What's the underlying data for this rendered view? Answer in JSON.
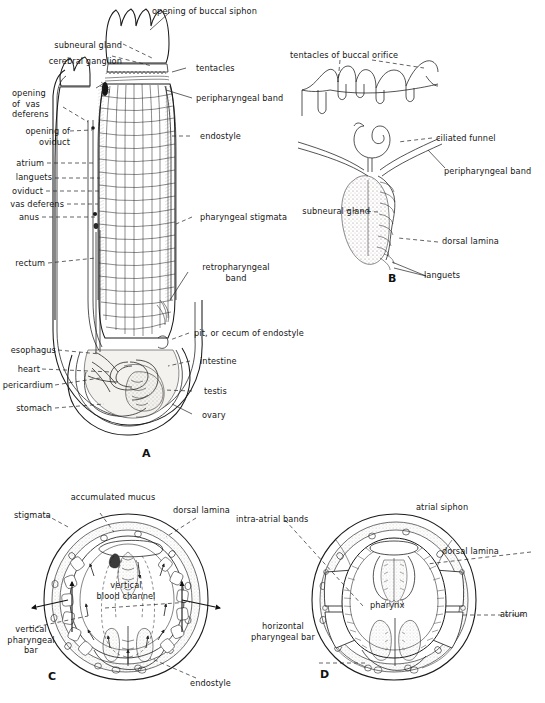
{
  "figure": {
    "panels": [
      {
        "id": "A",
        "letter": "A",
        "description": "Whole animal, left side view with body wall removed showing pharynx and viscera"
      },
      {
        "id": "B",
        "letter": "B",
        "description": "Detail of dorsal region: tentacles, ciliated funnel, subneural gland and dorsal lamina"
      },
      {
        "id": "C",
        "letter": "C",
        "description": "Transverse section of pharynx showing mucus and ciliary currents"
      },
      {
        "id": "D",
        "letter": "D",
        "description": "Transverse section showing pharynx, atrium and atrial siphon"
      }
    ],
    "caption_fragment": ""
  },
  "panelA": {
    "letter": "A",
    "labels": {
      "opening_of_buccal_siphon": "opening of buccal siphon",
      "subneural_gland": "subneural gland",
      "cerebral_ganglion": "cerebral ganglion",
      "opening_of_vas_deferens": "opening\nof  vas\ndeferens",
      "opening_of_oviduct": "opening of\noviduct",
      "atrium": "atrium",
      "languets": "languets",
      "oviduct": "oviduct",
      "vas_deferens": "vas deferens",
      "anus": "anus",
      "rectum": "rectum",
      "esophagus": "esophagus",
      "heart": "heart",
      "pericardium": "pericardium",
      "stomach": "stomach",
      "tentacles": "tentacles",
      "peripharyngeal_band": "peripharyngeal band",
      "endostyle": "endostyle",
      "pharyngeal_stigmata": "pharyngeal stigmata",
      "retropharyngeal_band": "retropharyngeal\nband",
      "pit_or_cecum_of_endostyle": "pit, or cecum of endostyle",
      "intestine": "intestine",
      "testis": "testis",
      "ovary": "ovary"
    }
  },
  "panelB": {
    "letter": "B",
    "labels": {
      "tentacles_of_buccal_orifice": "tentacles of buccal orifice",
      "ciliated_funnel": "ciliated funnel",
      "peripharyngeal_band": "peripharyngeal band",
      "subneural_gland": "subneural gland",
      "dorsal_lamina": "dorsal lamina",
      "languets": "languets"
    }
  },
  "panelC": {
    "letter": "C",
    "labels": {
      "accumulated_mucus": "accumulated mucus",
      "stigmata": "stigmata",
      "dorsal_lamina": "dorsal lamina",
      "vertical_blood_channel": "vertical\nblood channel",
      "vertical_pharyngeal_bar": "vertical\npharyngeal\nbar",
      "endostyle": "endostyle"
    }
  },
  "panelD": {
    "letter": "D",
    "labels": {
      "intra_atrial_bands": "intra-atrial bands",
      "atrial_siphon": "atrial siphon",
      "dorsal_lamina": "dorsal lamina",
      "atrium": "atrium",
      "pharynx": "pharynx",
      "horizontal_pharyngeal_bar": "horizontal\npharyngeal bar"
    }
  },
  "colors": {
    "ink": "#1b1b1b",
    "background": "#ffffff",
    "tissue_pale": "#f4f2ee",
    "tissue_grey": "#e3e0da",
    "tissue_dark": "#9b968e"
  }
}
